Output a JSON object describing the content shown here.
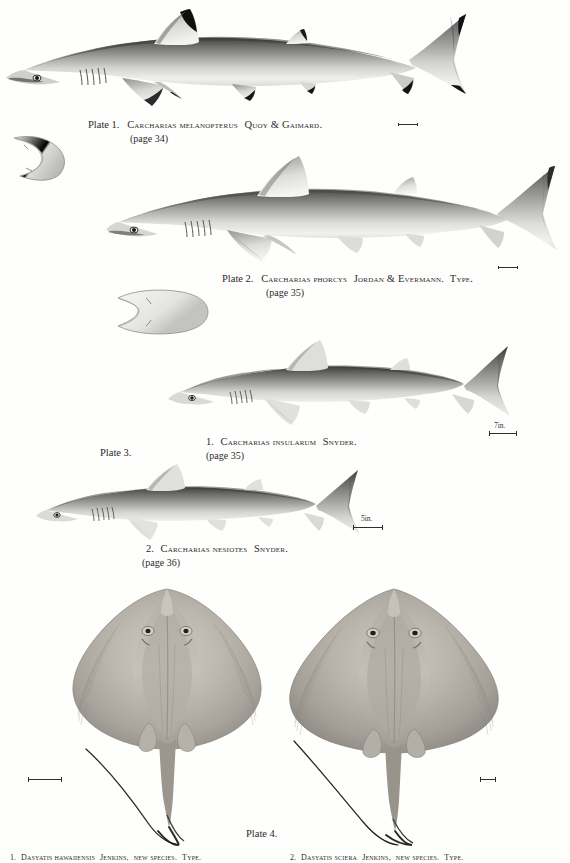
{
  "plate_page": {
    "plates": [
      {
        "id": "plate-1",
        "label": "Plate 1.",
        "species": "Carcharias melanopterus",
        "authority": "Quoy & Gaimard.",
        "page_ref": "(page 34)",
        "caption_full": "Plate 1.  Carcharias melanopterus Quoy & Gaimard.",
        "has_ventral_inset": true,
        "has_scale_mark": true
      },
      {
        "id": "plate-2",
        "label": "Plate 2.",
        "species": "Carcharias phorcys",
        "authority": "Jordan & Evermann.",
        "type_note": "Type.",
        "page_ref": "(page 35)",
        "caption_full": "Plate 2.  Carcharias phorcys Jordan & Evermann. Type.",
        "has_ventral_inset": true,
        "has_scale_mark": true
      },
      {
        "id": "plate-3",
        "label": "Plate 3.",
        "figures": [
          {
            "number": "1.",
            "species": "Carcharias insularum",
            "authority": "Snyder.",
            "page_ref": "(page 35)",
            "caption_full": "1. Carcharias insularum Snyder.",
            "scale_label": "7in."
          },
          {
            "number": "2.",
            "species": "Carcharias nesiotes",
            "authority": "Snyder.",
            "page_ref": "(page 36)",
            "caption_full": "2. Carcharias nesiotes Snyder.",
            "scale_label": "5in."
          }
        ]
      },
      {
        "id": "plate-4",
        "label": "Plate 4.",
        "figures": [
          {
            "number": "1.",
            "species": "Dasyatis hawaiiensis",
            "authority": "Jenkins,",
            "status": "new species.",
            "type_note": "Type.",
            "caption_full": "1. Dasyatis hawaiiensis Jenkins, new species. Type."
          },
          {
            "number": "2.",
            "species": "Dasyatis sciera",
            "authority": "Jenkins,",
            "status": "new species.",
            "type_note": "Type.",
            "caption_full": "2. Dasyatis sciera Jenkins, new species. Type."
          }
        ]
      }
    ],
    "colors": {
      "paper": "#fefefd",
      "ink": "#2a2a2a",
      "shark_body_light": "#e8e8e6",
      "shark_body_mid": "#9a9a98",
      "shark_body_dark": "#4a4a4a",
      "fin_tip_black": "#101010",
      "ray_body": "#b9b5ae",
      "ray_shadow": "#7d7a74"
    }
  }
}
